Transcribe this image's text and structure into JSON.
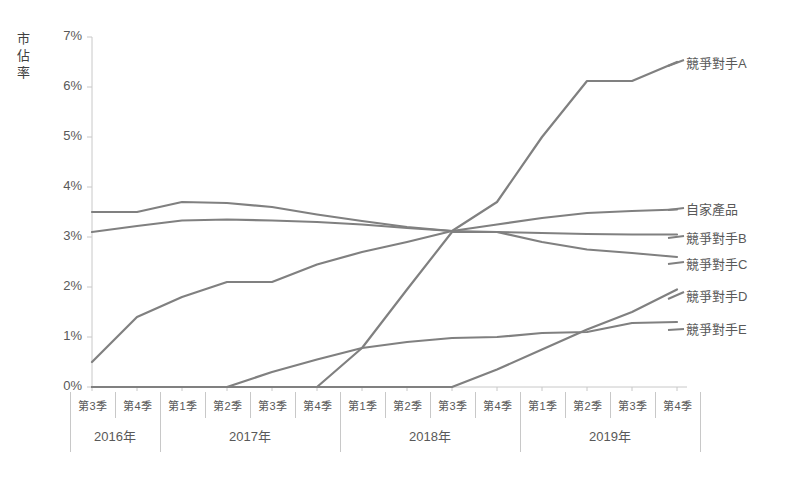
{
  "chart": {
    "title": "",
    "y_axis_title_chars": [
      "市",
      "佔",
      "率"
    ],
    "y_ticks": [
      "0%",
      "1%",
      "2%",
      "3%",
      "4%",
      "5%",
      "6%",
      "7%"
    ],
    "line_color": "#808080",
    "axis_color": "#c8c8c8",
    "text_color": "#595959"
  },
  "x_axis": {
    "quarters": [
      "第3季",
      "第4季",
      "第1季",
      "第2季",
      "第3季",
      "第4季",
      "第1季",
      "第2季",
      "第3季",
      "第4季",
      "第1季",
      "第2季",
      "第3季",
      "第4季"
    ],
    "years": [
      {
        "label": "2016年",
        "span": 2
      },
      {
        "label": "2017年",
        "span": 4
      },
      {
        "label": "2018年",
        "span": 4
      },
      {
        "label": "2019年",
        "span": 4
      }
    ]
  },
  "legend": [
    {
      "name": "競爭對手A",
      "y": 62
    },
    {
      "name": "自家產品",
      "y": 208
    },
    {
      "name": "競爭對手B",
      "y": 237
    },
    {
      "name": "競爭對手C",
      "y": 263
    },
    {
      "name": "競爭對手D",
      "y": 295
    },
    {
      "name": "競爭對手E",
      "y": 328
    }
  ],
  "chart_data": {
    "type": "line",
    "title": "",
    "xlabel": "",
    "ylabel": "市佔率",
    "ylim": [
      0,
      7
    ],
    "ytick_step": 1,
    "ytick_format": "percent",
    "grid": false,
    "legend_position": "right",
    "categories": [
      "2016 第3季",
      "2016 第4季",
      "2017 第1季",
      "2017 第2季",
      "2017 第3季",
      "2017 第4季",
      "2018 第1季",
      "2018 第2季",
      "2018 第3季",
      "2018 第4季",
      "2019 第1季",
      "2019 第2季",
      "2019 第3季",
      "2019 第4季"
    ],
    "series": [
      {
        "name": "自家產品",
        "values": [
          3.5,
          3.5,
          3.7,
          3.68,
          3.6,
          3.45,
          3.32,
          3.2,
          3.12,
          3.25,
          3.38,
          3.48,
          3.52,
          3.55
        ]
      },
      {
        "name": "競爭對手B",
        "values": [
          3.1,
          3.22,
          3.33,
          3.35,
          3.33,
          3.3,
          3.25,
          3.18,
          3.12,
          3.1,
          3.08,
          3.06,
          3.05,
          3.05
        ]
      },
      {
        "name": "競爭對手C",
        "values": [
          0.0,
          0.0,
          0.0,
          0.0,
          0.0,
          0.0,
          0.78,
          1.95,
          3.1,
          3.1,
          2.9,
          2.75,
          2.68,
          2.6
        ]
      },
      {
        "name": "競爭對手A",
        "values": [
          0.5,
          1.4,
          1.8,
          2.1,
          2.1,
          2.45,
          2.7,
          2.9,
          3.12,
          3.7,
          5.0,
          6.12,
          6.12,
          6.5
        ]
      },
      {
        "name": "競爭對手D",
        "values": [
          0.0,
          0.0,
          0.0,
          0.0,
          0.0,
          0.0,
          0.0,
          0.0,
          0.0,
          0.35,
          0.75,
          1.15,
          1.5,
          1.95
        ]
      },
      {
        "name": "競爭對手E",
        "values": [
          0.0,
          0.0,
          0.0,
          0.0,
          0.3,
          0.55,
          0.78,
          0.9,
          0.98,
          1.0,
          1.08,
          1.1,
          1.28,
          1.3
        ]
      }
    ]
  }
}
